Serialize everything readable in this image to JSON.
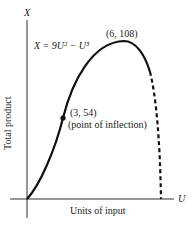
{
  "diagram": {
    "type": "total-product-curve",
    "axes": {
      "y_symbol": "X",
      "x_symbol": "U",
      "y_label": "Total product",
      "x_label": "Units of input"
    },
    "equation": "X = 9U² − U³",
    "annotations": {
      "maximum": "(6, 108)",
      "inflection_point": "(3, 54)",
      "inflection_note": "(point of inflection)"
    },
    "curve": {
      "solid_segment": "U from 0 to 6 and beyond peak",
      "dashed_segment": "declining portion to X = 0"
    },
    "colors": {
      "curve": "#111111",
      "axes": "#333333"
    }
  }
}
